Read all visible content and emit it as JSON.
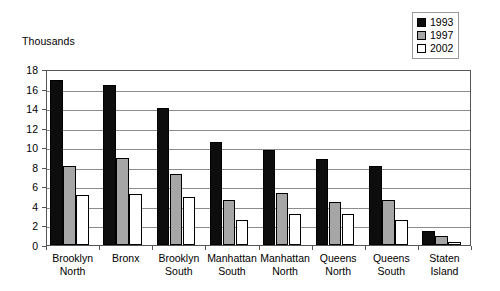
{
  "chart_data": {
    "type": "bar",
    "title": "",
    "subtitle": "",
    "unit_label": "Thousands",
    "xlabel": "",
    "ylabel": "",
    "ylim": [
      0,
      18
    ],
    "ytick_step": 2,
    "yticks": [
      0,
      2,
      4,
      6,
      8,
      10,
      12,
      14,
      16,
      18
    ],
    "ytick_labels": [
      "0",
      "2",
      "4",
      "6",
      "8",
      "10",
      "12",
      "14",
      "16",
      "18"
    ],
    "grid": true,
    "grid_axis": "y",
    "legend_position": "top-right",
    "categories": [
      "Brooklyn North",
      "Bronx",
      "Brooklyn South",
      "Manhattan South",
      "Manhattan North",
      "Queens North",
      "Queens South",
      "Staten Island"
    ],
    "category_lines": [
      [
        "Brooklyn",
        "North"
      ],
      [
        "Bronx",
        ""
      ],
      [
        "Brooklyn",
        "South"
      ],
      [
        "Manhattan",
        "South"
      ],
      [
        "Manhattan",
        "North"
      ],
      [
        "Queens",
        "North"
      ],
      [
        "Queens",
        "South"
      ],
      [
        "Staten",
        "Island"
      ]
    ],
    "series": [
      {
        "name": "1993",
        "color": "#0d0d0d",
        "values": [
          16.9,
          16.4,
          14.0,
          10.5,
          9.7,
          8.8,
          8.1,
          1.4
        ]
      },
      {
        "name": "1997",
        "color": "#a6a6a6",
        "values": [
          8.1,
          8.9,
          7.3,
          4.6,
          5.3,
          4.4,
          4.6,
          0.9
        ]
      },
      {
        "name": "2002",
        "color": "#ffffff",
        "values": [
          5.1,
          5.2,
          4.9,
          2.6,
          3.2,
          3.2,
          2.6,
          0.3
        ]
      }
    ]
  },
  "legend": {
    "items": [
      {
        "label": "1993",
        "color": "#0d0d0d"
      },
      {
        "label": "1997",
        "color": "#a6a6a6"
      },
      {
        "label": "2002",
        "color": "#ffffff"
      }
    ]
  }
}
